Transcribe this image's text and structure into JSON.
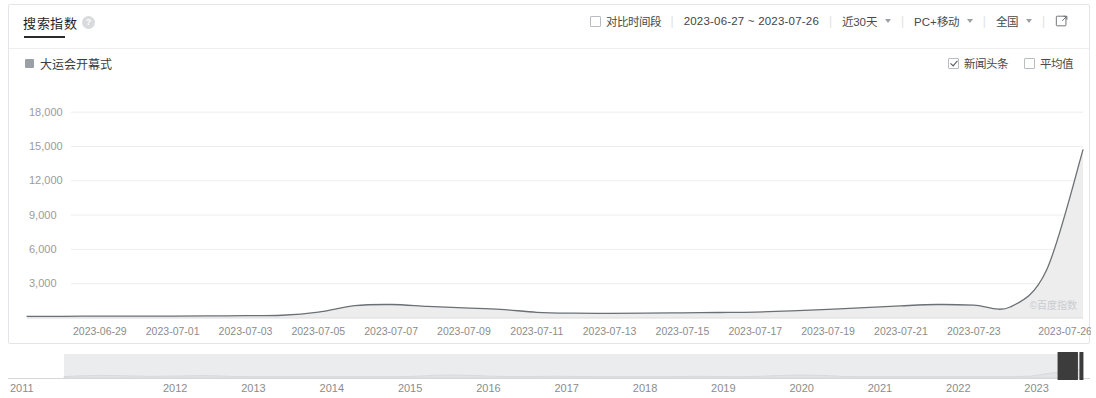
{
  "header": {
    "title": "搜索指数",
    "help_icon": "question-mark-icon",
    "compare_label": "对比时间段",
    "compare_checked": false,
    "date_range": "2023-06-27 ~ 2023-07-26",
    "period": "近30天",
    "device": "PC+移动",
    "region": "全国",
    "export_icon": "external-link-icon",
    "separator": "|"
  },
  "legend": {
    "keyword": "大运会开幕式",
    "news_label": "新闻头条",
    "news_checked": true,
    "average_label": "平均值",
    "average_checked": false
  },
  "watermark": "©百度指数",
  "colors": {
    "line": "#6b7075",
    "area": "#ededee",
    "accent": "#2b2b2b",
    "grid": "#ededed",
    "text": "#8c8c8c"
  },
  "brush": {
    "years": [
      "2011",
      "2012",
      "2013",
      "2014",
      "2015",
      "2016",
      "2017",
      "2018",
      "2019",
      "2020",
      "2021",
      "2022",
      "2023"
    ],
    "selection_left_pct": 97.6,
    "selection_right_pct": 99.6
  },
  "chart_data": {
    "type": "area",
    "title": "搜索指数",
    "series_name": "大运会开幕式",
    "xlabel": "",
    "ylabel": "搜索指数",
    "ylim": [
      0,
      19500
    ],
    "yticks": [
      3000,
      6000,
      9000,
      12000,
      15000,
      18000
    ],
    "ytick_labels": [
      "3,000",
      "6,000",
      "9,000",
      "12,000",
      "15,000",
      "18,000"
    ],
    "grid": true,
    "legend_position": "top-left",
    "xtick_labels": [
      "2023-06-29",
      "2023-07-01",
      "2023-07-03",
      "2023-07-05",
      "2023-07-07",
      "2023-07-09",
      "2023-07-11",
      "2023-07-13",
      "2023-07-15",
      "2023-07-17",
      "2023-07-19",
      "2023-07-21",
      "2023-07-23",
      "2023-07-26"
    ],
    "x": [
      "2023-06-27",
      "2023-06-28",
      "2023-06-29",
      "2023-06-30",
      "2023-07-01",
      "2023-07-02",
      "2023-07-03",
      "2023-07-04",
      "2023-07-05",
      "2023-07-06",
      "2023-07-07",
      "2023-07-08",
      "2023-07-09",
      "2023-07-10",
      "2023-07-11",
      "2023-07-12",
      "2023-07-13",
      "2023-07-14",
      "2023-07-15",
      "2023-07-16",
      "2023-07-17",
      "2023-07-18",
      "2023-07-19",
      "2023-07-20",
      "2023-07-21",
      "2023-07-22",
      "2023-07-23",
      "2023-07-24",
      "2023-07-25",
      "2023-07-26"
    ],
    "values": [
      150,
      150,
      160,
      160,
      170,
      180,
      200,
      240,
      520,
      1080,
      1180,
      1020,
      880,
      760,
      500,
      420,
      410,
      420,
      450,
      480,
      520,
      620,
      760,
      900,
      1060,
      1180,
      1130,
      960,
      4200,
      14700
    ]
  }
}
